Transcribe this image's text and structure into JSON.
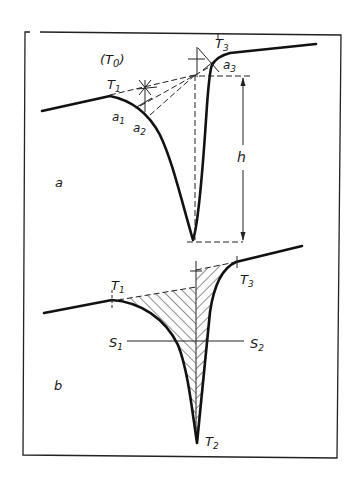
{
  "figure": {
    "panels": [
      {
        "id": "a",
        "panel_label": "a",
        "labels": {
          "t0": "(T",
          "t0_sub": "0",
          "t0_close": ")",
          "t1": "T",
          "t1_sub": "1",
          "a1": "a",
          "a1_sub": "1",
          "a2": "a",
          "a2_sub": "2",
          "t3": "T",
          "t3_sub": "3",
          "a3": "a",
          "a3_sub": "3",
          "h": "h"
        }
      },
      {
        "id": "b",
        "panel_label": "b",
        "labels": {
          "t1": "T",
          "t1_sub": "1",
          "t2": "T",
          "t2_sub": "2",
          "t3": "T",
          "t3_sub": "3",
          "s1": "S",
          "s1_sub": "1",
          "s2": "S",
          "s2_sub": "2"
        }
      }
    ],
    "colors": {
      "ink": "#111111",
      "background": "#ffffff"
    }
  }
}
